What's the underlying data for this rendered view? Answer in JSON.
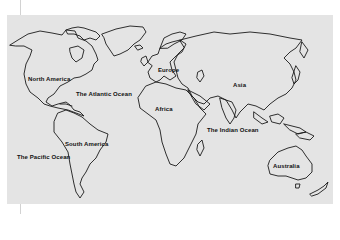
{
  "map": {
    "title": "",
    "background_color": "#e4e4e4",
    "outline_color": "#1a1a1a",
    "labels": {
      "north_america": "North America",
      "atlantic": "The Atlantic Ocean",
      "europe": "Europe",
      "asia": "Asia",
      "africa": "Africa",
      "south_america": "South America",
      "pacific": "The Pacific Ocean",
      "indian": "The Indian Ocean",
      "australia": "Australia"
    }
  }
}
